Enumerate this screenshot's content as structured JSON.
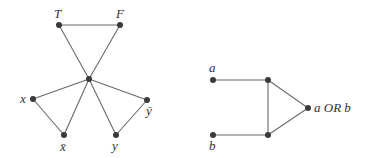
{
  "diagrams": [
    {
      "id": "variable-gadget",
      "labels": {
        "T": "T",
        "F": "F",
        "x": "x",
        "xbar": "x̄",
        "y": "y",
        "ybar": "ȳ"
      },
      "nodes": [
        {
          "id": "T",
          "x": 59,
          "y": 25
        },
        {
          "id": "F",
          "x": 120,
          "y": 25
        },
        {
          "id": "center",
          "x": 89,
          "y": 79
        },
        {
          "id": "x",
          "x": 33,
          "y": 99
        },
        {
          "id": "ybar",
          "x": 147,
          "y": 100
        },
        {
          "id": "xbar",
          "x": 64,
          "y": 135
        },
        {
          "id": "y",
          "x": 116,
          "y": 135
        }
      ],
      "edges": [
        [
          "T",
          "F"
        ],
        [
          "T",
          "center"
        ],
        [
          "F",
          "center"
        ],
        [
          "center",
          "x"
        ],
        [
          "center",
          "xbar"
        ],
        [
          "x",
          "xbar"
        ],
        [
          "center",
          "y"
        ],
        [
          "center",
          "ybar"
        ],
        [
          "y",
          "ybar"
        ]
      ]
    },
    {
      "id": "or-gadget",
      "labels": {
        "a": "a",
        "b": "b",
        "output": "a OR b"
      },
      "nodes": [
        {
          "id": "a",
          "x": 213,
          "y": 80
        },
        {
          "id": "b",
          "x": 213,
          "y": 135
        },
        {
          "id": "top",
          "x": 268,
          "y": 80
        },
        {
          "id": "bottom",
          "x": 268,
          "y": 135
        },
        {
          "id": "out",
          "x": 308,
          "y": 108
        }
      ],
      "edges": [
        [
          "a",
          "top"
        ],
        [
          "b",
          "bottom"
        ],
        [
          "top",
          "bottom"
        ],
        [
          "top",
          "out"
        ],
        [
          "bottom",
          "out"
        ]
      ]
    }
  ]
}
